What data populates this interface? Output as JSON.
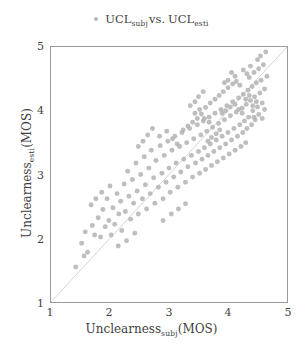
{
  "legend": {
    "marker_icon": "dot-marker-icon",
    "series_label_main": "UCL",
    "series_label_sub1": "subj",
    "vs_text": "vs.",
    "series_label_main2": "UCL",
    "series_label_sub2": "esti",
    "marker_color": "#b9b9b9"
  },
  "axes": {
    "x_title_main": "Unclearness",
    "x_title_sub": "subj",
    "x_title_unit": "(MOS)",
    "y_title_main": "Unclearness",
    "y_title_sub": "esti",
    "y_title_unit": "(MOS)",
    "x_ticks": [
      "1",
      "2",
      "3",
      "4",
      "5"
    ],
    "y_ticks": [
      "1",
      "2",
      "3",
      "4",
      "5"
    ]
  },
  "style": {
    "frame_color": "#9a9a9a",
    "identity_line_color": "#d3d3d3",
    "point_color": "#b3b3b3",
    "background": "#ffffff"
  },
  "chart_data": {
    "type": "scatter",
    "title": "",
    "xlabel": "Unclearness_subj(MOS)",
    "ylabel": "Unclearness_esti(MOS)",
    "legend": "UCL_subj vs. UCL_esti",
    "legend_position": "top-center",
    "grid": false,
    "xlim": [
      1,
      5
    ],
    "ylim": [
      1,
      5
    ],
    "xticks": [
      1,
      2,
      3,
      4,
      5
    ],
    "yticks": [
      1,
      2,
      3,
      4,
      5
    ],
    "marker": {
      "shape": "circle",
      "color": "#b3b3b3",
      "size_px": 5,
      "opacity": 0.85
    },
    "reference_line": {
      "type": "identity",
      "from": [
        1,
        1
      ],
      "to": [
        5,
        5
      ],
      "color": "#d3d3d3",
      "width_px": 1
    },
    "series": [
      {
        "name": "UCL_subj vs. UCL_esti",
        "points": [
          [
            1.42,
            1.55
          ],
          [
            1.52,
            1.92
          ],
          [
            1.58,
            2.1
          ],
          [
            1.62,
            1.78
          ],
          [
            1.7,
            2.2
          ],
          [
            1.74,
            2.05
          ],
          [
            1.8,
            2.32
          ],
          [
            1.84,
            2.02
          ],
          [
            1.88,
            2.45
          ],
          [
            1.92,
            2.18
          ],
          [
            1.95,
            2.62
          ],
          [
            1.98,
            2.28
          ],
          [
            2.02,
            2.05
          ],
          [
            2.05,
            2.48
          ],
          [
            2.08,
            2.22
          ],
          [
            2.12,
            2.7
          ],
          [
            2.15,
            2.38
          ],
          [
            2.18,
            2.58
          ],
          [
            2.2,
            2.12
          ],
          [
            2.24,
            2.85
          ],
          [
            2.26,
            2.42
          ],
          [
            2.3,
            3.05
          ],
          [
            2.32,
            2.66
          ],
          [
            2.35,
            2.3
          ],
          [
            2.38,
            2.92
          ],
          [
            2.4,
            2.55
          ],
          [
            2.44,
            3.18
          ],
          [
            2.46,
            2.74
          ],
          [
            2.48,
            2.38
          ],
          [
            2.52,
            3.0
          ],
          [
            2.55,
            2.62
          ],
          [
            2.58,
            3.28
          ],
          [
            2.6,
            2.84
          ],
          [
            2.62,
            2.46
          ],
          [
            2.66,
            3.1
          ],
          [
            2.68,
            2.7
          ],
          [
            2.7,
            3.38
          ],
          [
            2.74,
            2.95
          ],
          [
            2.76,
            2.55
          ],
          [
            2.78,
            3.22
          ],
          [
            2.82,
            2.8
          ],
          [
            2.85,
            3.45
          ],
          [
            2.88,
            3.02
          ],
          [
            2.9,
            2.62
          ],
          [
            2.92,
            3.3
          ],
          [
            2.95,
            2.88
          ],
          [
            2.98,
            3.52
          ],
          [
            3.0,
            3.1
          ],
          [
            3.02,
            2.72
          ],
          [
            3.05,
            3.38
          ],
          [
            3.08,
            2.96
          ],
          [
            3.1,
            3.6
          ],
          [
            3.12,
            3.18
          ],
          [
            3.15,
            2.8
          ],
          [
            3.18,
            3.44
          ],
          [
            3.2,
            3.04
          ],
          [
            3.22,
            3.66
          ],
          [
            3.25,
            3.24
          ],
          [
            3.28,
            2.88
          ],
          [
            3.3,
            3.5
          ],
          [
            3.32,
            3.12
          ],
          [
            3.35,
            3.72
          ],
          [
            3.38,
            3.3
          ],
          [
            3.4,
            2.96
          ],
          [
            3.42,
            3.56
          ],
          [
            3.45,
            3.18
          ],
          [
            3.48,
            3.78
          ],
          [
            3.5,
            3.36
          ],
          [
            3.52,
            3.02
          ],
          [
            3.54,
            3.62
          ],
          [
            3.56,
            3.24
          ],
          [
            3.58,
            3.84
          ],
          [
            3.6,
            3.42
          ],
          [
            3.62,
            3.08
          ],
          [
            3.64,
            3.68
          ],
          [
            3.66,
            3.3
          ],
          [
            3.68,
            3.9
          ],
          [
            3.7,
            3.48
          ],
          [
            3.72,
            3.14
          ],
          [
            3.74,
            3.74
          ],
          [
            3.76,
            3.36
          ],
          [
            3.78,
            3.96
          ],
          [
            3.8,
            3.54
          ],
          [
            3.82,
            3.2
          ],
          [
            3.84,
            3.8
          ],
          [
            3.86,
            3.42
          ],
          [
            3.88,
            4.02
          ],
          [
            3.9,
            3.6
          ],
          [
            3.92,
            3.26
          ],
          [
            3.94,
            3.86
          ],
          [
            3.96,
            3.48
          ],
          [
            3.98,
            4.08
          ],
          [
            4.0,
            3.66
          ],
          [
            4.02,
            3.32
          ],
          [
            4.04,
            3.92
          ],
          [
            4.06,
            3.54
          ],
          [
            4.08,
            4.14
          ],
          [
            4.1,
            3.72
          ],
          [
            4.12,
            3.38
          ],
          [
            4.14,
            3.98
          ],
          [
            4.16,
            3.6
          ],
          [
            4.18,
            4.2
          ],
          [
            4.2,
            3.78
          ],
          [
            4.22,
            3.44
          ],
          [
            4.24,
            4.04
          ],
          [
            4.25,
            3.66
          ],
          [
            4.26,
            4.26
          ],
          [
            4.28,
            3.84
          ],
          [
            4.3,
            3.5
          ],
          [
            4.31,
            4.1
          ],
          [
            4.32,
            3.72
          ],
          [
            4.34,
            4.32
          ],
          [
            4.35,
            3.9
          ],
          [
            4.36,
            4.52
          ],
          [
            4.38,
            4.16
          ],
          [
            4.4,
            3.78
          ],
          [
            4.41,
            4.38
          ],
          [
            4.42,
            4.0
          ],
          [
            4.44,
            4.6
          ],
          [
            4.45,
            4.22
          ],
          [
            4.46,
            3.86
          ],
          [
            4.48,
            4.44
          ],
          [
            4.5,
            4.06
          ],
          [
            4.52,
            4.66
          ],
          [
            4.54,
            4.28
          ],
          [
            4.55,
            4.86
          ],
          [
            4.56,
            4.48
          ],
          [
            4.58,
            4.12
          ],
          [
            4.6,
            4.72
          ],
          [
            4.62,
            4.34
          ],
          [
            4.64,
            4.92
          ],
          [
            4.66,
            4.54
          ],
          [
            3.55,
            3.95
          ],
          [
            3.62,
            4.05
          ],
          [
            3.7,
            4.12
          ],
          [
            3.78,
            4.18
          ],
          [
            3.85,
            4.24
          ],
          [
            3.92,
            4.3
          ],
          [
            4.0,
            4.36
          ],
          [
            4.08,
            4.42
          ],
          [
            3.48,
            3.88
          ],
          [
            3.4,
            3.82
          ],
          [
            3.32,
            3.76
          ],
          [
            3.24,
            3.7
          ],
          [
            3.9,
            3.96
          ],
          [
            3.96,
            4.0
          ],
          [
            4.04,
            4.06
          ],
          [
            4.12,
            4.1
          ],
          [
            4.18,
            4.02
          ],
          [
            4.24,
            3.96
          ],
          [
            4.3,
            4.18
          ],
          [
            4.36,
            4.24
          ],
          [
            3.66,
            3.52
          ],
          [
            3.72,
            3.58
          ],
          [
            3.8,
            3.64
          ],
          [
            3.86,
            3.7
          ],
          [
            4.42,
            4.08
          ],
          [
            4.48,
            4.14
          ],
          [
            4.14,
            4.46
          ],
          [
            4.2,
            4.4
          ],
          [
            3.58,
            4.3
          ],
          [
            3.5,
            4.22
          ],
          [
            3.44,
            4.14
          ],
          [
            3.36,
            4.08
          ],
          [
            2.72,
            3.72
          ],
          [
            2.64,
            3.62
          ],
          [
            2.56,
            3.52
          ],
          [
            2.48,
            3.44
          ],
          [
            1.68,
            2.52
          ],
          [
            1.76,
            2.62
          ],
          [
            1.86,
            2.72
          ],
          [
            2.0,
            2.82
          ],
          [
            2.9,
            2.28
          ],
          [
            3.04,
            2.38
          ],
          [
            3.16,
            2.46
          ],
          [
            3.28,
            2.54
          ],
          [
            4.52,
            3.94
          ],
          [
            4.58,
            3.88
          ],
          [
            4.62,
            4.02
          ],
          [
            4.44,
            3.9
          ],
          [
            2.14,
            1.88
          ],
          [
            2.28,
            1.96
          ],
          [
            2.42,
            2.08
          ],
          [
            1.56,
            1.72
          ],
          [
            3.44,
            3.96
          ],
          [
            3.52,
            4.02
          ],
          [
            3.6,
            3.88
          ],
          [
            3.68,
            3.82
          ],
          [
            4.06,
            4.6
          ],
          [
            4.12,
            4.54
          ],
          [
            4.0,
            4.48
          ],
          [
            3.94,
            4.44
          ],
          [
            2.84,
            3.6
          ],
          [
            2.96,
            3.68
          ],
          [
            3.06,
            3.56
          ],
          [
            3.14,
            3.48
          ],
          [
            4.26,
            4.64
          ],
          [
            4.32,
            4.58
          ],
          [
            4.38,
            4.7
          ],
          [
            4.5,
            4.8
          ]
        ]
      }
    ]
  }
}
